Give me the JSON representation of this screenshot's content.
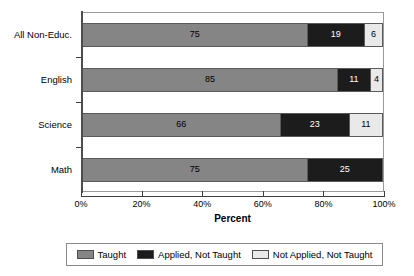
{
  "chart_data": {
    "type": "bar",
    "orientation": "horizontal",
    "stacked": true,
    "title": "",
    "xlabel": "Percent",
    "ylabel": "",
    "xlim": [
      0,
      100
    ],
    "xtick_labels": [
      "0%",
      "20%",
      "40%",
      "60%",
      "80%",
      "100%"
    ],
    "xtick_values": [
      0,
      20,
      40,
      60,
      80,
      100
    ],
    "grid": false,
    "legend_position": "bottom",
    "categories": [
      "All Non-Educ.",
      "English",
      "Science",
      "Math"
    ],
    "series": [
      {
        "name": "Taught",
        "color": "#858585",
        "values": [
          75,
          85,
          66,
          75
        ]
      },
      {
        "name": "Applied, Not Taught",
        "color": "#1c1c1c",
        "values": [
          19,
          11,
          23,
          25
        ]
      },
      {
        "name": "Not Applied, Not Taught",
        "color": "#e9e9e9",
        "values": [
          6,
          4,
          11,
          0
        ]
      }
    ],
    "rows": [
      {
        "category": "All Non-Educ.",
        "segments": [
          {
            "series": "Taught",
            "value": 75,
            "label": "75"
          },
          {
            "series": "Applied, Not Taught",
            "value": 19,
            "label": "19"
          },
          {
            "series": "Not Applied, Not Taught",
            "value": 6,
            "label": "6"
          }
        ]
      },
      {
        "category": "English",
        "segments": [
          {
            "series": "Taught",
            "value": 85,
            "label": "85"
          },
          {
            "series": "Applied, Not Taught",
            "value": 11,
            "label": "11"
          },
          {
            "series": "Not Applied, Not Taught",
            "value": 4,
            "label": "4"
          }
        ]
      },
      {
        "category": "Science",
        "segments": [
          {
            "series": "Taught",
            "value": 66,
            "label": "66"
          },
          {
            "series": "Applied, Not Taught",
            "value": 23,
            "label": "23"
          },
          {
            "series": "Not Applied, Not Taught",
            "value": 11,
            "label": "11"
          }
        ]
      },
      {
        "category": "Math",
        "segments": [
          {
            "series": "Taught",
            "value": 75,
            "label": "75"
          },
          {
            "series": "Applied, Not Taught",
            "value": 25,
            "label": "25"
          }
        ]
      }
    ],
    "legend": [
      {
        "label": "Taught",
        "color": "#858585"
      },
      {
        "label": "Applied, Not Taught",
        "color": "#1c1c1c"
      },
      {
        "label": "Not Applied, Not Taught",
        "color": "#e9e9e9"
      }
    ]
  }
}
